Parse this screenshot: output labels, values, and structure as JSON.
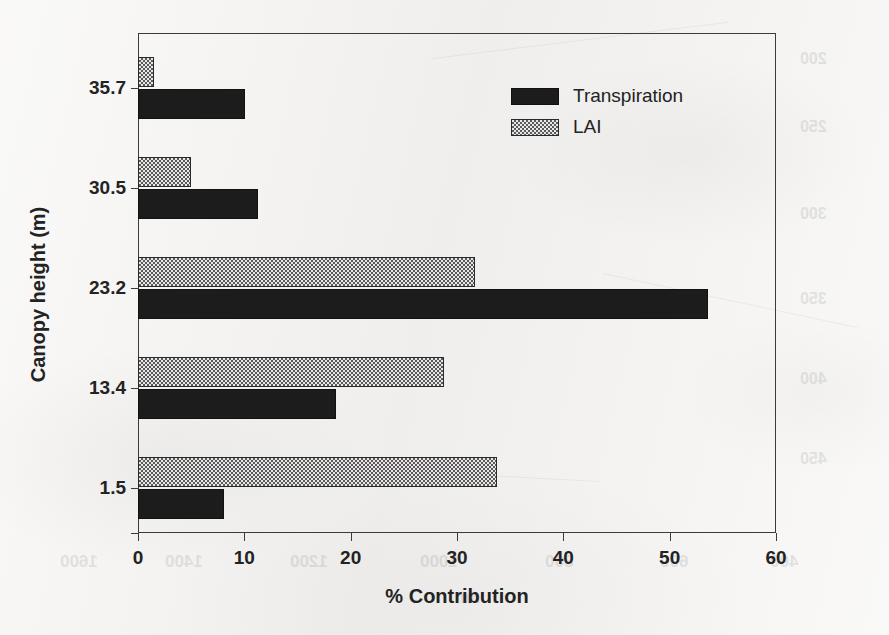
{
  "chart_data": {
    "type": "bar",
    "orientation": "horizontal",
    "title": "",
    "xlabel": "% Contribution",
    "ylabel": "Canopy height (m)",
    "categories": [
      "35.7",
      "30.5",
      "23.2",
      "13.4",
      "1.5"
    ],
    "xlim": [
      0,
      60
    ],
    "xticks": [
      0,
      10,
      20,
      30,
      40,
      50,
      60
    ],
    "grid": false,
    "legend_position": "top-right",
    "series": [
      {
        "name": "Transpiration",
        "fill": "solid-black",
        "color": "#1c1c1c",
        "values": [
          10.1,
          11.3,
          53.6,
          18.6,
          8.1
        ]
      },
      {
        "name": "LAI",
        "fill": "checkered",
        "color": "#cfcfcf",
        "values": [
          1.5,
          5.0,
          31.7,
          28.8,
          33.8
        ]
      }
    ]
  },
  "axes": {
    "x": {
      "title": "% Contribution",
      "tick_labels": [
        "0",
        "10",
        "20",
        "30",
        "40",
        "50",
        "60"
      ]
    },
    "y": {
      "title": "Canopy height (m)",
      "tick_labels": [
        "35.7",
        "30.5",
        "23.2",
        "13.4",
        "1.5"
      ]
    }
  },
  "legend": {
    "items": [
      {
        "label": "Transpiration",
        "swatch": "solid-black-swatch"
      },
      {
        "label": "LAI",
        "swatch": "checkered-swatch"
      }
    ]
  },
  "ghost_text": [
    {
      "text": "1600",
      "x": 60,
      "y": 552,
      "size": 17
    },
    {
      "text": "1400",
      "x": 165,
      "y": 552,
      "size": 17
    },
    {
      "text": "1200",
      "x": 290,
      "y": 552,
      "size": 17
    },
    {
      "text": "1000",
      "x": 420,
      "y": 552,
      "size": 17
    },
    {
      "text": "800",
      "x": 545,
      "y": 552,
      "size": 17
    },
    {
      "text": "600",
      "x": 660,
      "y": 552,
      "size": 17
    },
    {
      "text": "400",
      "x": 770,
      "y": 552,
      "size": 17
    },
    {
      "text": "nm",
      "x": 455,
      "y": 588,
      "size": 17
    },
    {
      "text": "200",
      "x": 800,
      "y": 50,
      "size": 16
    },
    {
      "text": "250",
      "x": 800,
      "y": 118,
      "size": 16
    },
    {
      "text": "300",
      "x": 800,
      "y": 205,
      "size": 16
    },
    {
      "text": "350",
      "x": 800,
      "y": 290,
      "size": 16
    },
    {
      "text": "400",
      "x": 800,
      "y": 370,
      "size": 16
    },
    {
      "text": "450",
      "x": 800,
      "y": 450,
      "size": 16
    }
  ]
}
